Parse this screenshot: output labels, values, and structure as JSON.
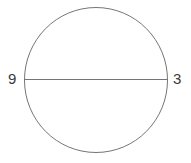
{
  "figure": {
    "kind": "circle-with-diameter",
    "background_color": "#ffffff",
    "stroke_color": "#757575",
    "label_color": "#3a3a3a",
    "stroke_width": 1,
    "circle": {
      "center_x": 96,
      "center_y": 80,
      "radius_x": 72,
      "radius_y": 73
    },
    "diameter": {
      "x1": 25,
      "y1": 80,
      "x2": 167,
      "y2": 80,
      "orientation": "horizontal"
    }
  },
  "labels": {
    "left": "9",
    "right": "3"
  },
  "chart_data": {
    "type": "scatter",
    "title": "",
    "xlabel": "",
    "ylabel": "",
    "categories": [
      "9",
      "3"
    ],
    "values": [
      9,
      3
    ],
    "annotations": [
      {
        "text": "9",
        "x": 25,
        "y": 80,
        "position": "left-of-circle"
      },
      {
        "text": "3",
        "x": 167,
        "y": 80,
        "position": "right-of-circle"
      }
    ],
    "shapes": [
      {
        "shape": "circle",
        "cx": 96,
        "cy": 80,
        "rx": 72,
        "ry": 73,
        "fill": "none",
        "stroke": "#757575"
      },
      {
        "shape": "line",
        "x1": 25,
        "y1": 80,
        "x2": 167,
        "y2": 80,
        "stroke": "#757575"
      }
    ],
    "grid": false,
    "legend": "none"
  }
}
